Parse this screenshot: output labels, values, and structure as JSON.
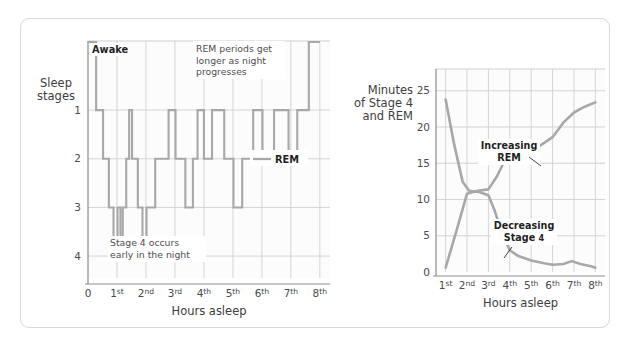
{
  "figure": {
    "background": "#ffffff",
    "border_color": "#d9d9d9",
    "series_color": "#a8a8a8",
    "grid_color": "#d0d0d0",
    "axis_color": "#8c8c8c"
  },
  "left_chart": {
    "y_axis_title_line1": "Sleep",
    "y_axis_title_line2": "stages",
    "x_axis_title": "Hours asleep",
    "y_ticks": [
      "1",
      "2",
      "3",
      "4"
    ],
    "x_ticks": [
      "0",
      "1st",
      "2nd",
      "3rd",
      "4th",
      "5th",
      "6th",
      "7th",
      "8th"
    ],
    "awake_label": "Awake",
    "legend_label": "REM",
    "annotation_rem": "REM periods get longer as night progresses",
    "annotation_rem_lines": [
      "REM periods get",
      "longer as night",
      "progresses"
    ],
    "annotation_stage4": "Stage 4 occurs early in the night",
    "annotation_stage4_lines": [
      "Stage 4 occurs",
      "early in the night"
    ]
  },
  "right_chart": {
    "y_axis_title_lines": [
      "Minutes",
      "of Stage 4",
      "and REM"
    ],
    "x_axis_title": "Hours asleep",
    "y_ticks": [
      "0",
      "5",
      "10",
      "15",
      "20",
      "25"
    ],
    "x_ticks": [
      "1st",
      "2nd",
      "3rd",
      "4th",
      "5th",
      "6th",
      "7th",
      "8th"
    ],
    "annotation_rem_lines": [
      "Increasing",
      "REM"
    ],
    "annotation_stage4_lines": [
      "Decreasing",
      "Stage 4"
    ]
  },
  "chart_data": [
    {
      "type": "line",
      "name": "hypnogram",
      "title": "Sleep stages across the night",
      "xlabel": "Hours asleep",
      "ylabel": "Sleep stages",
      "xlim": [
        0,
        8.35
      ],
      "ylim": [
        4.45,
        -0.42
      ],
      "y_tick_values": [
        1,
        2,
        3,
        4
      ],
      "y_tick_labels": [
        "1",
        "2",
        "3",
        "4"
      ],
      "extra_y_label": "Awake",
      "extra_y_value": -0.4,
      "x_tick_values": [
        0,
        1,
        2,
        3,
        4,
        5,
        6,
        7,
        8
      ],
      "x_tick_labels": [
        "0",
        "1st",
        "2nd",
        "3rd",
        "4th",
        "5th",
        "6th",
        "7th",
        "8th"
      ],
      "grid": true,
      "legend": [
        "REM"
      ],
      "step_style": "post",
      "note": "Stage value -0.4 = Awake; 1 = Stage 1 / REM; 4 = deepest sleep",
      "x": [
        0.0,
        0.28,
        0.28,
        0.52,
        0.52,
        0.72,
        0.72,
        0.88,
        0.88,
        1.02,
        1.02,
        1.12,
        1.12,
        1.2,
        1.2,
        1.32,
        1.32,
        1.42,
        1.42,
        1.52,
        1.52,
        1.72,
        1.72,
        1.88,
        1.88,
        2.02,
        2.02,
        2.32,
        2.32,
        2.78,
        2.78,
        3.02,
        3.02,
        3.36,
        3.36,
        3.62,
        3.62,
        3.78,
        3.78,
        4.0,
        4.0,
        4.28,
        4.28,
        4.7,
        4.7,
        5.02,
        5.02,
        5.32,
        5.32,
        5.7,
        5.7,
        6.02,
        6.02,
        6.42,
        6.42,
        6.92,
        6.92,
        7.22,
        7.22,
        7.62,
        7.62,
        8.0
      ],
      "y": [
        -0.4,
        -0.4,
        1.0,
        1.0,
        2.0,
        2.0,
        3.0,
        3.0,
        4.0,
        4.0,
        3.0,
        3.0,
        4.0,
        4.0,
        3.0,
        3.0,
        2.0,
        2.0,
        1.0,
        1.0,
        2.0,
        2.0,
        3.0,
        3.0,
        4.0,
        4.0,
        3.0,
        3.0,
        2.0,
        2.0,
        1.0,
        1.0,
        2.0,
        2.0,
        3.0,
        3.0,
        2.0,
        2.0,
        1.0,
        1.0,
        2.0,
        2.0,
        1.0,
        1.0,
        2.0,
        2.0,
        3.0,
        3.0,
        2.0,
        2.0,
        1.0,
        1.0,
        2.0,
        2.0,
        1.0,
        1.0,
        2.0,
        2.0,
        1.0,
        1.0,
        -0.4,
        -0.4
      ]
    },
    {
      "type": "line",
      "name": "rem-and-stage4-minutes",
      "title": "Minutes of Stage 4 and REM by hour asleep",
      "xlabel": "Hours asleep",
      "ylabel": "Minutes of Stage 4 and REM",
      "xlim": [
        0.55,
        8.45
      ],
      "ylim": [
        0,
        28
      ],
      "y_tick_values": [
        0,
        5,
        10,
        15,
        20,
        25
      ],
      "y_tick_labels": [
        "0",
        "5",
        "10",
        "15",
        "20",
        "25"
      ],
      "x_tick_values": [
        1,
        2,
        3,
        4,
        5,
        6,
        7,
        8
      ],
      "x_tick_labels": [
        "1st",
        "2nd",
        "3rd",
        "4th",
        "5th",
        "6th",
        "7th",
        "8th"
      ],
      "grid": true,
      "series": [
        {
          "name": "Increasing REM",
          "x": [
            1.0,
            1.5,
            2.0,
            2.5,
            3.0,
            3.4,
            3.8,
            4.4,
            5.0,
            5.4,
            6.0,
            6.5,
            7.0,
            7.5,
            8.0
          ],
          "values": [
            0.6,
            5.6,
            10.8,
            11.2,
            11.4,
            13.2,
            15.6,
            16.4,
            17.2,
            17.4,
            18.6,
            20.6,
            22.0,
            22.8,
            23.4
          ]
        },
        {
          "name": "Decreasing Stage 4",
          "x": [
            1.0,
            1.4,
            1.8,
            2.1,
            2.6,
            3.0,
            3.3,
            3.6,
            4.0,
            4.4,
            5.0,
            5.6,
            6.0,
            6.5,
            6.9,
            7.3,
            7.8,
            8.0
          ],
          "values": [
            23.8,
            17.6,
            12.4,
            11.2,
            11.0,
            10.6,
            8.4,
            5.6,
            3.0,
            2.2,
            1.6,
            1.2,
            1.0,
            1.1,
            1.5,
            1.1,
            0.8,
            0.6
          ]
        }
      ]
    }
  ]
}
